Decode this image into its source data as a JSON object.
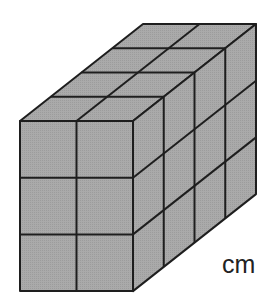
{
  "figure": {
    "dimensions": {
      "width_cubes": 2,
      "height_cubes": 3,
      "depth_cubes": 4
    },
    "unit_label": "cm",
    "colors": {
      "fill": "#a9a9a9",
      "stroke": "#1e1e1e",
      "background": "#ffffff"
    },
    "geometry": {
      "front_origin": [
        20,
        121
      ],
      "cube_w": 56.5,
      "cube_h": 56.7,
      "depth_vec": [
        30.75,
        -24.25
      ]
    }
  }
}
